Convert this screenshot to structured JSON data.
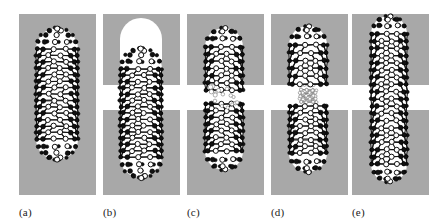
{
  "figure": {
    "width": 442,
    "height": 220,
    "background_color": "#ffffff",
    "substrate_color": "#a8a8a8",
    "void_color": "#ffffff",
    "atom_color": "#ffffff",
    "bond_color": "#151515",
    "label_color": "#1a1a1a"
  },
  "layout": {
    "panel_width": 77,
    "panel_x": [
      19,
      103,
      187,
      271,
      352
    ],
    "slab_top_y": 14,
    "slab_top_height": 71,
    "slab_bottom_y": 110,
    "slab_bottom_height": 85,
    "gap_y": 85,
    "gap_height": 25,
    "label_y": 200
  },
  "panels": [
    {
      "id": "a",
      "label": "(a)",
      "caption": "Intact capped nanotube embedded in continuous substrate",
      "substrate": "continuous",
      "slab_top": {
        "x": 0,
        "y": 14,
        "w": 77,
        "h": 181
      },
      "slab_bottom": null,
      "void": null,
      "tube": {
        "state": "intact",
        "center_x": 38,
        "top_y": 28,
        "bottom_y": 160,
        "radius": 21,
        "rings": 15,
        "atoms_per_ring": 11,
        "style": "dense"
      },
      "fragments": []
    },
    {
      "id": "b",
      "label": "(b)",
      "caption": "Nanotube displaced downward leaving a rounded void above the cap",
      "substrate": "split",
      "slab_top": {
        "x": 0,
        "y": 14,
        "w": 77,
        "h": 71
      },
      "slab_bottom": {
        "x": 0,
        "y": 110,
        "w": 77,
        "h": 85
      },
      "void": {
        "cx": 38,
        "top_y": 18,
        "bottom_y": 62,
        "radius": 21
      },
      "tube": {
        "state": "intact",
        "center_x": 38,
        "top_y": 48,
        "bottom_y": 178,
        "radius": 21,
        "rings": 15,
        "atoms_per_ring": 11,
        "style": "dense"
      },
      "fragments": []
    },
    {
      "id": "c",
      "label": "(c)",
      "caption": "Nanotube fractured into two separate capped fragments with scattered atoms in the gap",
      "substrate": "split",
      "slab_top": {
        "x": 0,
        "y": 14,
        "w": 77,
        "h": 71
      },
      "slab_bottom": {
        "x": 0,
        "y": 110,
        "w": 77,
        "h": 85
      },
      "void": null,
      "tube": null,
      "fragments": [
        {
          "name": "upper-fragment",
          "center_x": 37,
          "top_y": 28,
          "bottom_y": 90,
          "radius": 19,
          "rings": 7,
          "atoms_per_ring": 11,
          "style": "dense",
          "cap": "top"
        },
        {
          "name": "lower-fragment",
          "center_x": 37,
          "top_y": 104,
          "bottom_y": 170,
          "radius": 19,
          "rings": 8,
          "atoms_per_ring": 11,
          "style": "dense",
          "cap": "bottom"
        }
      ],
      "debris": {
        "count": 16,
        "region": {
          "x": 22,
          "y": 86,
          "w": 32,
          "h": 22
        }
      }
    },
    {
      "id": "d",
      "label": "(d)",
      "caption": "Necked nanotube: a thin strained chain bridges the upper and lower segments",
      "substrate": "split",
      "slab_top": {
        "x": 0,
        "y": 14,
        "w": 77,
        "h": 71
      },
      "slab_bottom": {
        "x": 0,
        "y": 110,
        "w": 77,
        "h": 85
      },
      "void": null,
      "tube": null,
      "fragments": [
        {
          "name": "upper-segment",
          "center_x": 37,
          "top_y": 26,
          "bottom_y": 84,
          "radius": 19,
          "rings": 6,
          "atoms_per_ring": 11,
          "style": "dense",
          "cap": "top"
        },
        {
          "name": "lower-segment",
          "center_x": 37,
          "top_y": 106,
          "bottom_y": 172,
          "radius": 19,
          "rings": 8,
          "atoms_per_ring": 11,
          "style": "dense",
          "cap": "bottom"
        }
      ],
      "neck": {
        "name": "neck-bridge",
        "center_x": 37,
        "top_y": 82,
        "bottom_y": 110,
        "radius": 8,
        "rings": 5,
        "atoms_per_ring": 7,
        "style": "faint"
      },
      "debris": {
        "count": 0,
        "region": null
      }
    },
    {
      "id": "e",
      "label": "(e)",
      "caption": "Fully elongated nanotube spanning the widened gap without breaking",
      "substrate": "split",
      "slab_top": {
        "x": 0,
        "y": 14,
        "w": 77,
        "h": 71
      },
      "slab_bottom": {
        "x": 0,
        "y": 110,
        "w": 77,
        "h": 85
      },
      "void": null,
      "tube": {
        "state": "stretched",
        "center_x": 37,
        "top_y": 16,
        "bottom_y": 182,
        "radius": 18,
        "rings": 19,
        "atoms_per_ring": 11,
        "style": "dense"
      },
      "fragments": []
    }
  ]
}
